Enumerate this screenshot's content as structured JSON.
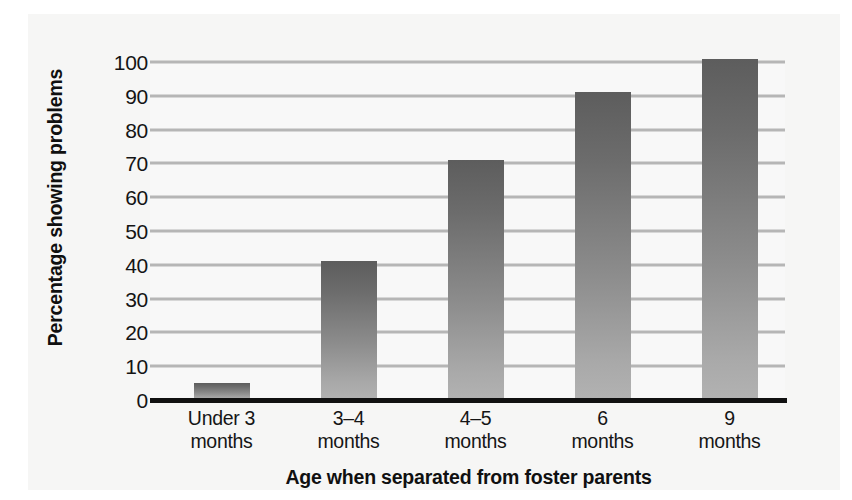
{
  "chart_data": {
    "type": "bar",
    "title": "",
    "xlabel": "Age when separated from foster parents",
    "ylabel": "Percentage showing problems",
    "categories": [
      "Under 3 months",
      "3–4 months",
      "4–5 months",
      "6 months",
      "9 months"
    ],
    "category_lines": [
      {
        "line1": "Under 3",
        "line2": "months"
      },
      {
        "line1": "3–4",
        "line2": "months"
      },
      {
        "line1": "4–5",
        "line2": "months"
      },
      {
        "line1": "6",
        "line2": "months"
      },
      {
        "line1": "9",
        "line2": "months"
      }
    ],
    "values": [
      5,
      41,
      71,
      91,
      101
    ],
    "ylim": [
      0,
      100
    ],
    "ytick_step": 10,
    "yticks": [
      "0",
      "10",
      "20",
      "30",
      "40",
      "50",
      "60",
      "70",
      "80",
      "90",
      "100"
    ],
    "grid": true,
    "legend": "none",
    "colors": {
      "bar_top": "#5d5d5d",
      "bar_bottom": "#b2b2b2",
      "gridline": "#b6b6b6",
      "axis_line": "#111111",
      "plot_background": "#f8f8f8",
      "page_background": "#f6f6f5",
      "text": "#141414"
    }
  }
}
